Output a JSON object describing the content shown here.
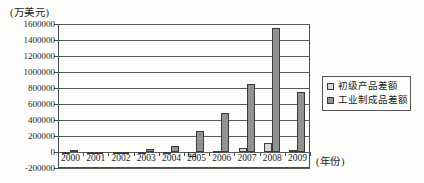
{
  "figure": {
    "y_axis_unit": "(万美元)",
    "x_axis_unit": "(年份)"
  },
  "chart_data": {
    "type": "bar",
    "title": "",
    "ylabel": "(万美元)",
    "xlabel": "(年份)",
    "categories": [
      "2000",
      "2001",
      "2002",
      "2003",
      "2004",
      "2005",
      "2006",
      "2007",
      "2008",
      "2009"
    ],
    "series": [
      {
        "name": "初级产品差额",
        "color": "#d8d8d8",
        "values": [
          -10000,
          -10000,
          -10000,
          -12000,
          -15000,
          -60000,
          8000,
          55000,
          115000,
          25000
        ]
      },
      {
        "name": "工业制成品差额",
        "color": "#929292",
        "values": [
          30000,
          -30000,
          -25000,
          40000,
          75000,
          265000,
          490000,
          850000,
          1550000,
          750000
        ]
      }
    ],
    "ylim": [
      -200000,
      1600000
    ],
    "ytick_step": 200000,
    "ytick_labels": [
      "1600000",
      "1400000",
      "1200000",
      "1000000",
      "800000",
      "600000",
      "400000",
      "200000",
      "0",
      "-200000"
    ],
    "grid": true,
    "legend_position": "right"
  },
  "legend": {
    "items": [
      {
        "label": "初级产品差额",
        "swatch": "#d8d8d8"
      },
      {
        "label": "工业制成品差额",
        "swatch": "#929292"
      }
    ]
  }
}
